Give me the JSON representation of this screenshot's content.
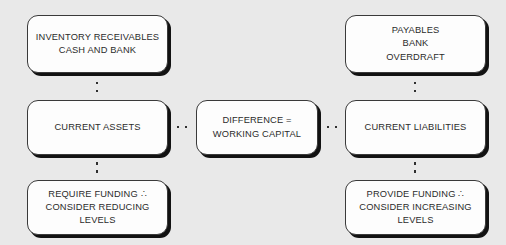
{
  "diagram": {
    "background_color": "#e9e9e9",
    "box_fill_color": "#fdfdfd",
    "box_border_color": "#3a3a3a",
    "box_shadow_color": "#121212",
    "text_color": "#2b2b2b",
    "nodes": [
      {
        "id": "inventory-receivables",
        "label": "INVENTORY RECEIVABLES\nCASH AND BANK",
        "column": "left",
        "row": "top"
      },
      {
        "id": "current-assets",
        "label": "CURRENT ASSETS",
        "column": "left",
        "row": "middle"
      },
      {
        "id": "require-funding",
        "label": "REQUIRE FUNDING ∴\nCONSIDER REDUCING\nLEVELS",
        "column": "left",
        "row": "bottom"
      },
      {
        "id": "difference",
        "label": "DIFFERENCE =\nWORKING CAPITAL",
        "column": "center",
        "row": "middle"
      },
      {
        "id": "payables",
        "label": "PAYABLES\nBANK\nOVERDRAFT",
        "column": "right",
        "row": "top"
      },
      {
        "id": "current-liabilities",
        "label": "CURRENT LIABILITIES",
        "column": "right",
        "row": "middle"
      },
      {
        "id": "provide-funding",
        "label": "PROVIDE FUNDING ∴\nCONSIDER INCREASING\nLEVELS",
        "column": "right",
        "row": "bottom"
      }
    ],
    "connectors": [
      {
        "id": "assets-top",
        "from": "inventory-receivables",
        "to": "current-assets",
        "orientation": "vertical",
        "style": "dotted",
        "dot_count": 2
      },
      {
        "id": "assets-bottom",
        "from": "current-assets",
        "to": "require-funding",
        "orientation": "vertical",
        "style": "dotted",
        "dot_count": 2
      },
      {
        "id": "liab-top",
        "from": "payables",
        "to": "current-liabilities",
        "orientation": "vertical",
        "style": "dotted",
        "dot_count": 2
      },
      {
        "id": "liab-bottom",
        "from": "current-liabilities",
        "to": "provide-funding",
        "orientation": "vertical",
        "style": "dotted",
        "dot_count": 2
      },
      {
        "id": "left-center",
        "from": "current-assets",
        "to": "difference",
        "orientation": "horizontal",
        "style": "dotted",
        "dot_count": 2
      },
      {
        "id": "center-right",
        "from": "difference",
        "to": "current-liabilities",
        "orientation": "horizontal",
        "style": "dotted",
        "dot_count": 2
      }
    ]
  }
}
